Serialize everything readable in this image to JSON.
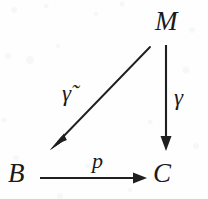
{
  "diagram": {
    "kind": "commutative-diagram",
    "title": "",
    "background_color": "#fefefe",
    "ink_color": "#1f1f1f",
    "nodes": [
      {
        "id": "M",
        "label": "M",
        "x": 168,
        "y": 22
      },
      {
        "id": "B",
        "label": "B",
        "x": 18,
        "y": 174
      },
      {
        "id": "C",
        "label": "C",
        "x": 165,
        "y": 174
      }
    ],
    "edges": [
      {
        "id": "gamma-tilde",
        "label": "γ̃",
        "from": "M",
        "to": "B",
        "style": "solid",
        "direction": "diagonal-down-left",
        "x1": 150,
        "y1": 47,
        "x2": 53,
        "y2": 147
      },
      {
        "id": "gamma",
        "label": "γ",
        "from": "M",
        "to": "C",
        "style": "solid",
        "direction": "down",
        "x1": 166,
        "y1": 45,
        "x2": 166,
        "y2": 150
      },
      {
        "id": "p",
        "label": "p",
        "from": "B",
        "to": "C",
        "style": "solid",
        "direction": "right",
        "x1": 40,
        "y1": 178,
        "x2": 146,
        "y2": 178
      }
    ]
  }
}
